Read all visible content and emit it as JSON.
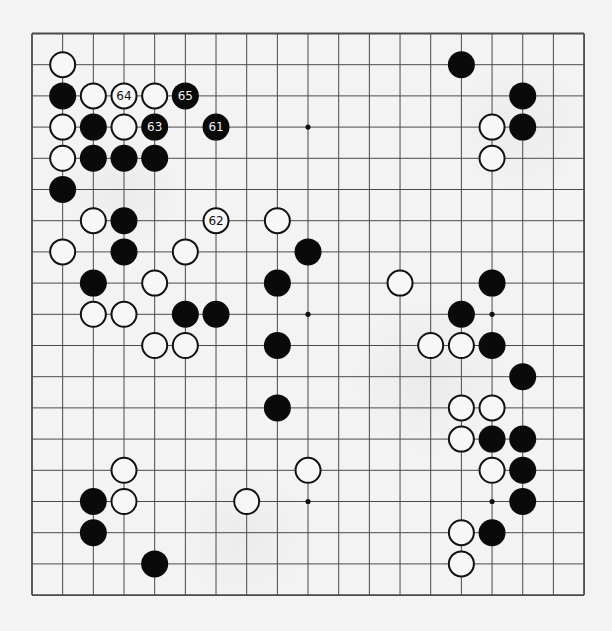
{
  "board": {
    "size": 19,
    "origin": {
      "x": 32,
      "y": 33.5
    },
    "spacing": {
      "x": 30.67,
      "y": 31.2
    },
    "line_color": "#4a4a4a",
    "background": "#f3f3f3",
    "stone_radius": 13.5
  },
  "star_points": [
    [
      9,
      3
    ],
    [
      9,
      9
    ],
    [
      15,
      9
    ],
    [
      9,
      15
    ],
    [
      15,
      15
    ]
  ],
  "stones": {
    "black": [
      [
        1,
        2
      ],
      [
        2,
        3
      ],
      [
        2,
        4
      ],
      [
        3,
        4
      ],
      [
        4,
        4
      ],
      [
        1,
        5
      ],
      [
        3,
        6
      ],
      [
        3,
        7
      ],
      [
        9,
        7
      ],
      [
        2,
        8
      ],
      [
        8,
        8
      ],
      [
        5,
        9
      ],
      [
        6,
        9
      ],
      [
        8,
        10
      ],
      [
        8,
        12
      ],
      [
        2,
        15
      ],
      [
        2,
        16
      ],
      [
        4,
        17
      ],
      [
        14,
        1
      ],
      [
        16,
        2
      ],
      [
        16,
        3
      ],
      [
        15,
        8
      ],
      [
        14,
        9
      ],
      [
        15,
        10
      ],
      [
        16,
        11
      ],
      [
        15,
        13
      ],
      [
        16,
        13
      ],
      [
        16,
        14
      ],
      [
        16,
        15
      ],
      [
        15,
        16
      ]
    ],
    "white": [
      [
        1,
        1
      ],
      [
        2,
        2
      ],
      [
        4,
        2
      ],
      [
        1,
        3
      ],
      [
        3,
        3
      ],
      [
        1,
        4
      ],
      [
        2,
        6
      ],
      [
        8,
        6
      ],
      [
        1,
        7
      ],
      [
        5,
        7
      ],
      [
        4,
        8
      ],
      [
        2,
        9
      ],
      [
        3,
        9
      ],
      [
        4,
        10
      ],
      [
        5,
        10
      ],
      [
        3,
        14
      ],
      [
        9,
        14
      ],
      [
        3,
        15
      ],
      [
        7,
        15
      ],
      [
        15,
        3
      ],
      [
        15,
        4
      ],
      [
        12,
        8
      ],
      [
        13,
        10
      ],
      [
        14,
        10
      ],
      [
        14,
        12
      ],
      [
        15,
        12
      ],
      [
        14,
        13
      ],
      [
        15,
        14
      ],
      [
        14,
        16
      ],
      [
        14,
        17
      ]
    ]
  },
  "numbered_moves": [
    {
      "n": "61",
      "color": "black",
      "pos": [
        6,
        3
      ]
    },
    {
      "n": "62",
      "color": "white",
      "pos": [
        6,
        6
      ]
    },
    {
      "n": "63",
      "color": "black",
      "pos": [
        4,
        3
      ]
    },
    {
      "n": "64",
      "color": "white",
      "pos": [
        3,
        2
      ]
    },
    {
      "n": "65",
      "color": "black",
      "pos": [
        5,
        2
      ]
    }
  ]
}
